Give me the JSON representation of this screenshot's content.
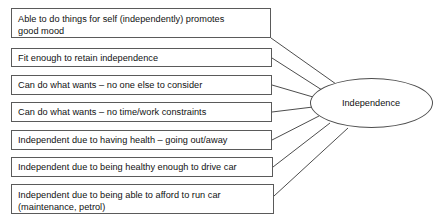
{
  "diagram": {
    "type": "radial-concept-map",
    "hub": {
      "label": "Independence",
      "shape": "ellipse",
      "cx": 371,
      "cy": 103,
      "rx": 61.5,
      "ry": 25
    },
    "style": {
      "background_color": "#ffffff",
      "box_border_color": "#5a5a5a",
      "ellipse_border_color": "#4d4d4d",
      "connector_color": "#4d4d4d",
      "text_color": "#111111"
    },
    "nodes": [
      {
        "id": "node-1",
        "label": "Able to do things for self (independently) promotes good mood",
        "lines": [
          "Able to do things for self (independently) promotes",
          "good mood"
        ],
        "x": 11,
        "y": 8,
        "width": 260,
        "height": 30,
        "anchor_x": 271,
        "anchor_y": 38
      },
      {
        "id": "node-2",
        "label": "Fit enough to retain independence",
        "lines": [
          "Fit enough to retain independence"
        ],
        "x": 11,
        "y": 48,
        "width": 261,
        "height": 19,
        "anchor_x": 272,
        "anchor_y": 58
      },
      {
        "id": "node-3",
        "label": "Can do what wants – no one else to consider",
        "lines": [
          "Can do what wants – no one else to consider"
        ],
        "x": 11,
        "y": 75,
        "width": 261,
        "height": 20,
        "anchor_x": 272,
        "anchor_y": 85
      },
      {
        "id": "node-4",
        "label": "Can do what wants – no time/work constraints",
        "lines": [
          "Can do what wants – no time/work constraints"
        ],
        "x": 11,
        "y": 102,
        "width": 261,
        "height": 20,
        "anchor_x": 272,
        "anchor_y": 112
      },
      {
        "id": "node-5",
        "label": "Independent due to having health – going out/away",
        "lines": [
          "Independent due to having health – going out/away"
        ],
        "x": 11,
        "y": 130,
        "width": 261,
        "height": 20,
        "anchor_x": 272,
        "anchor_y": 140
      },
      {
        "id": "node-6",
        "label": "Independent due to being healthy enough to drive car",
        "lines": [
          "Independent due to being healthy enough to drive car"
        ],
        "x": 11,
        "y": 157,
        "width": 262,
        "height": 20,
        "anchor_x": 273,
        "anchor_y": 167
      },
      {
        "id": "node-7",
        "label": "Independent due to being able to afford to run car (maintenance, petrol)",
        "lines": [
          "Independent due to being able to afford to run car",
          "(maintenance, petrol)"
        ],
        "x": 11,
        "y": 184,
        "width": 263,
        "height": 30,
        "anchor_x": 274,
        "anchor_y": 196
      }
    ],
    "connectors": [
      {
        "id": "connector-1",
        "from": "node-1",
        "to": "hub",
        "x1": 271,
        "y1": 38,
        "x2": 336,
        "y2": 84
      },
      {
        "id": "connector-2",
        "from": "node-2",
        "to": "hub",
        "x1": 272,
        "y1": 58,
        "x2": 322,
        "y2": 90
      },
      {
        "id": "connector-3",
        "from": "node-3",
        "to": "hub",
        "x1": 272,
        "y1": 85,
        "x2": 313,
        "y2": 97
      },
      {
        "id": "connector-4",
        "from": "node-4",
        "to": "hub",
        "x1": 272,
        "y1": 112,
        "x2": 313,
        "y2": 107
      },
      {
        "id": "connector-5",
        "from": "node-5",
        "to": "hub",
        "x1": 272,
        "y1": 140,
        "x2": 319,
        "y2": 116
      },
      {
        "id": "connector-6",
        "from": "node-6",
        "to": "hub",
        "x1": 273,
        "y1": 167,
        "x2": 330,
        "y2": 123
      },
      {
        "id": "connector-7",
        "from": "node-7",
        "to": "hub",
        "x1": 274,
        "y1": 196,
        "x2": 348,
        "y2": 128
      }
    ]
  }
}
